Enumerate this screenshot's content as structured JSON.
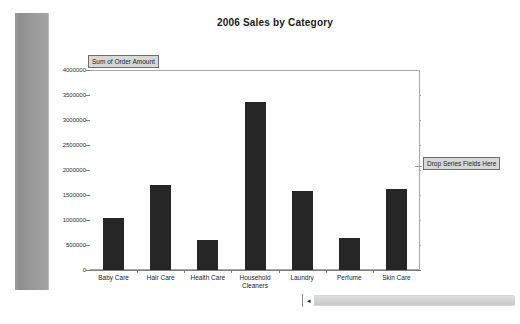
{
  "window": {
    "title": "2006 Sales by Category"
  },
  "chart_data": {
    "type": "bar",
    "title": "2006 Sales by Category",
    "xlabel": "",
    "ylabel": "Sum of Order Amount",
    "categories": [
      "Baby Care",
      "Hair Care",
      "Health Care",
      "Household\nCleaners",
      "Laundry",
      "Perfume",
      "Skin Care"
    ],
    "values": [
      1040000,
      1700000,
      600000,
      3360000,
      1590000,
      640000,
      1620000
    ],
    "ylim": [
      0,
      4000000
    ],
    "ytick_labels": [
      "4000000",
      "3500000",
      "3000000",
      "2500000",
      "2000000",
      "1500000",
      "1000000",
      "500000",
      "0"
    ],
    "ytick_values": [
      4000000,
      3500000,
      3000000,
      2500000,
      2000000,
      1500000,
      1000000,
      500000,
      0
    ],
    "grid": true,
    "legend": "none",
    "bar_color": "#262626",
    "gridline_color": "#b4b4b4",
    "plot_background": "#ffffff"
  },
  "pivot": {
    "totals_field_label": "Sum of Order Amount",
    "series_drop_label": "Drop Series Fields Here"
  },
  "tabs": {
    "items": [
      {
        "label": "Sales Pivot",
        "active": false
      },
      {
        "label": "Category Sales",
        "active": true
      },
      {
        "label": "CategoryPivot",
        "active": false
      },
      {
        "label": "2006 Orders",
        "active": false
      }
    ],
    "scroll_button_glyph": "◂"
  }
}
